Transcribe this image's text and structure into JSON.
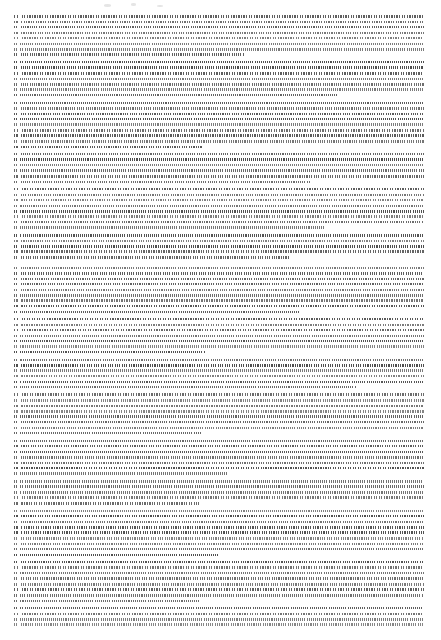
{
  "document": {
    "kind": "scanned-text-page",
    "legibility": "illegible",
    "legibility_note": "Body text is rendered below the resolution limit of this 441x640 raster; no word, heading, page number, caption or figure is readable at any zoom level, so no text content is transcribed.",
    "page": {
      "width": 441,
      "height": 640,
      "background_color": "#ffffff"
    },
    "text_block": {
      "left": 14,
      "top": 14,
      "right": 424,
      "bottom": 628,
      "width": 410,
      "height": 614,
      "alignment": "justified",
      "average_tone": "#9a9a9a",
      "ink_color": "#3c3c3c",
      "line_pitch_px": 5.5,
      "approx_line_count": 110
    },
    "gutter": {
      "left": 18,
      "width": 2,
      "top": 14,
      "height": 614,
      "color": "#ffffff"
    },
    "section_break": {
      "y": 261,
      "description": "full-width horizontal break separating the two major text sections"
    },
    "margins": {
      "left": 14,
      "right": 17,
      "top": 14,
      "bottom": 12
    },
    "header": null,
    "footer": null,
    "page_number": null,
    "figures": [],
    "paragraph_line_counts": [
      8,
      7,
      9,
      6,
      8,
      5,
      9,
      7,
      6,
      8,
      7,
      5,
      9,
      8,
      6,
      7
    ],
    "artifacts": [
      {
        "x": 104,
        "y": 4,
        "w": 7,
        "h": 3
      },
      {
        "x": 131,
        "y": 3,
        "w": 5,
        "h": 3
      },
      {
        "x": 157,
        "y": 5,
        "w": 6,
        "h": 2
      }
    ]
  }
}
